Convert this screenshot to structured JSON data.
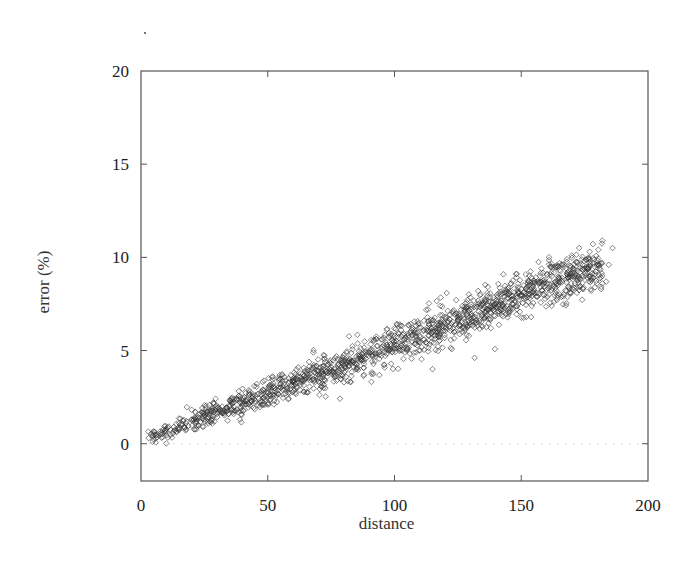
{
  "chart_data": {
    "type": "scatter",
    "title": "",
    "xlabel": "distance",
    "ylabel": "error (%)",
    "xlim": [
      0,
      200
    ],
    "ylim": [
      -2,
      20
    ],
    "xticks": [
      0,
      50,
      100,
      150,
      200
    ],
    "yticks": [
      0,
      5,
      10,
      15,
      20
    ],
    "xtick_labels": [
      "0",
      "50",
      "100",
      "150",
      "200"
    ],
    "ytick_labels": [
      "0",
      "5",
      "10",
      "15",
      "20"
    ],
    "grid": false,
    "legend": null,
    "marker": "diamond",
    "marker_color": "#333333",
    "reference_line": {
      "y": 0,
      "style": "dotted",
      "color": "#d8d8d8"
    },
    "series": [
      {
        "name": "error vs distance",
        "trend": {
          "description": "dense band, roughly linear increase",
          "center": [
            [
              3,
              0.3
            ],
            [
              25,
              1.4
            ],
            [
              50,
              2.8
            ],
            [
              75,
              4.0
            ],
            [
              100,
              5.3
            ],
            [
              125,
              6.6
            ],
            [
              150,
              8.0
            ],
            [
              170,
              9.0
            ],
            [
              182,
              9.6
            ]
          ],
          "spread_sd": [
            [
              3,
              0.2
            ],
            [
              50,
              0.4
            ],
            [
              100,
              0.5
            ],
            [
              150,
              0.6
            ],
            [
              182,
              0.55
            ]
          ],
          "x_range": [
            2,
            184
          ],
          "approx_point_count": 1500
        },
        "points": [
          [
            3,
            0.3
          ],
          [
            5,
            0.5
          ],
          [
            8,
            0.6
          ],
          [
            10,
            0.8
          ],
          [
            13,
            0.9
          ],
          [
            15,
            1.1
          ],
          [
            18,
            1.2
          ],
          [
            20,
            1.3
          ],
          [
            25,
            1.5
          ],
          [
            28,
            1.9
          ],
          [
            30,
            1.6
          ],
          [
            35,
            2.0
          ],
          [
            38,
            2.4
          ],
          [
            40,
            2.2
          ],
          [
            45,
            2.6
          ],
          [
            48,
            2.1
          ],
          [
            50,
            2.8
          ],
          [
            52,
            3.6
          ],
          [
            55,
            3.0
          ],
          [
            58,
            2.4
          ],
          [
            60,
            3.3
          ],
          [
            62,
            4.1
          ],
          [
            65,
            3.5
          ],
          [
            68,
            4.9
          ],
          [
            70,
            3.9
          ],
          [
            72,
            3.0
          ],
          [
            75,
            4.1
          ],
          [
            80,
            4.4
          ],
          [
            85,
            4.7
          ],
          [
            88,
            3.7
          ],
          [
            90,
            4.9
          ],
          [
            95,
            5.2
          ],
          [
            100,
            5.3
          ],
          [
            102,
            6.4
          ],
          [
            105,
            5.6
          ],
          [
            110,
            5.8
          ],
          [
            115,
            4.0
          ],
          [
            118,
            6.9
          ],
          [
            120,
            6.3
          ],
          [
            125,
            6.6
          ],
          [
            130,
            6.9
          ],
          [
            133,
            8.2
          ],
          [
            135,
            7.2
          ],
          [
            138,
            6.2
          ],
          [
            140,
            7.5
          ],
          [
            145,
            7.8
          ],
          [
            148,
            9.1
          ],
          [
            150,
            8.0
          ],
          [
            152,
            6.8
          ],
          [
            155,
            8.3
          ],
          [
            158,
            9.4
          ],
          [
            160,
            8.6
          ],
          [
            162,
            7.4
          ],
          [
            165,
            8.9
          ],
          [
            168,
            9.9
          ],
          [
            170,
            9.0
          ],
          [
            172,
            8.1
          ],
          [
            175,
            9.4
          ],
          [
            177,
            10.3
          ],
          [
            180,
            9.6
          ],
          [
            181.5,
            8.3
          ],
          [
            182,
            9.0
          ],
          [
            182,
            10.9
          ],
          [
            183.5,
            8.7
          ],
          [
            184.5,
            9.6
          ],
          [
            186,
            10.5
          ]
        ]
      }
    ]
  }
}
